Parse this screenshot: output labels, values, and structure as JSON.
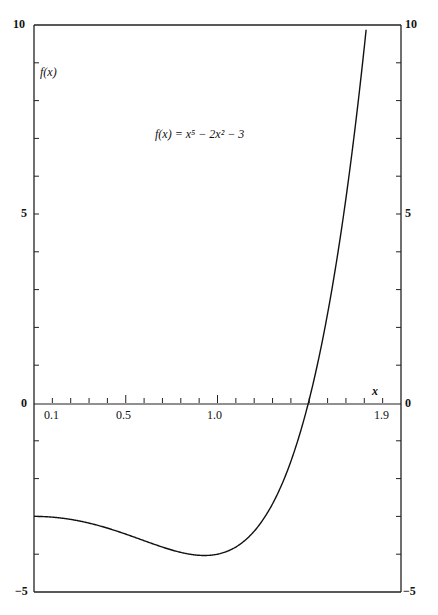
{
  "chart_data": {
    "type": "line",
    "title": "",
    "annotation": "f(x) = x⁵ − 2x² − 3",
    "xlabel": "x",
    "ylabel": "f(x)",
    "xlim": [
      0,
      2.0
    ],
    "ylim": [
      -5,
      10
    ],
    "grid": false,
    "legend": null,
    "x_tick_labels": [
      "0.1",
      "0.5",
      "1.0",
      "1.9"
    ],
    "x_ticks_minor_step": 0.1,
    "y_tick_labels_left": [
      "10",
      "5",
      "0",
      "−5"
    ],
    "y_tick_labels_right": [
      "10",
      "5",
      "0",
      "−5"
    ],
    "y_ticks_minor_step": 1,
    "series": [
      {
        "name": "f(x) = x^5 - 2x^2 - 3",
        "x": [
          0.0,
          0.1,
          0.2,
          0.3,
          0.4,
          0.5,
          0.6,
          0.7,
          0.8,
          0.9,
          0.93,
          1.0,
          1.1,
          1.2,
          1.3,
          1.4,
          1.5,
          1.6,
          1.7,
          1.8,
          1.81
        ],
        "values": [
          -3.0,
          -3.02,
          -3.08,
          -3.18,
          -3.31,
          -3.47,
          -3.64,
          -3.81,
          -3.95,
          -4.03,
          -4.03,
          -4.0,
          -3.81,
          -3.39,
          -2.67,
          -1.54,
          0.09,
          2.37,
          5.42,
          9.42,
          9.94
        ]
      }
    ]
  },
  "labels": {
    "y_axis_title": "f(x)",
    "x_axis_title": "x",
    "equation": "f(x) = x⁵ − 2x² − 3",
    "left_10": "10",
    "left_5": "5",
    "left_0": "0",
    "left_m5": "−5",
    "right_10": "10",
    "right_5": "5",
    "right_0": "0",
    "right_m5": "−5",
    "x_01": "0.1",
    "x_05": "0.5",
    "x_10": "1.0",
    "x_19": "1.9"
  }
}
